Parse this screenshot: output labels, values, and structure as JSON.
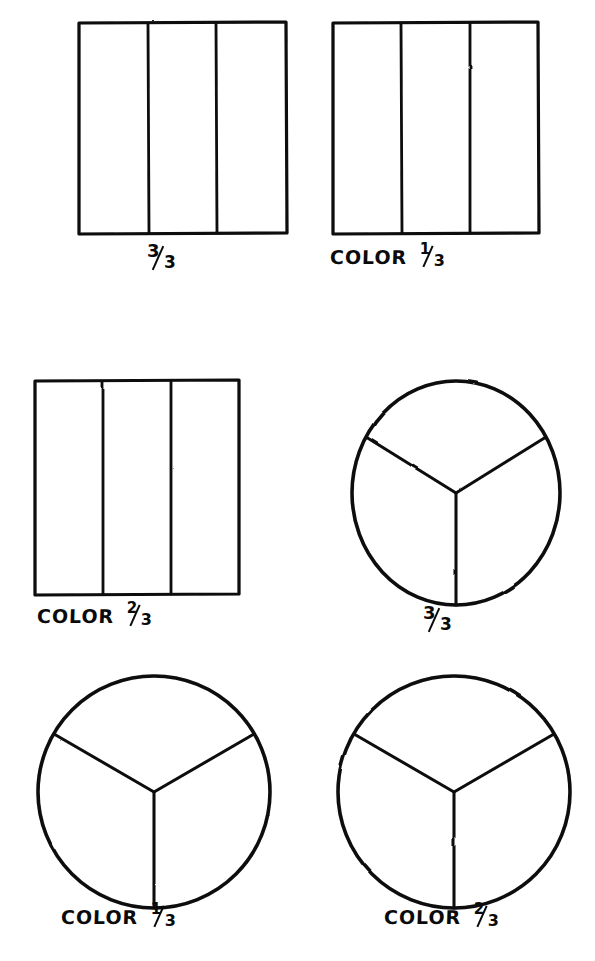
{
  "page": {
    "background_color": "#ffffff",
    "ink_color": "#0a0a0a",
    "width": 595,
    "height": 961
  },
  "figures": [
    {
      "id": "rect-thirds-1",
      "shape": "rectangle",
      "divisions": 3,
      "division_type": "vertical-bars",
      "shaded_parts": 0,
      "label": "3/3",
      "label_prefix": "",
      "label_numerator": "3",
      "label_denominator": "3",
      "row": 1,
      "column": 1
    },
    {
      "id": "rect-thirds-2",
      "shape": "rectangle",
      "divisions": 3,
      "division_type": "vertical-bars",
      "shaded_parts": 1,
      "label": "COLOR 1/3",
      "label_prefix": "COLOR",
      "label_numerator": "1",
      "label_denominator": "3",
      "row": 1,
      "column": 2
    },
    {
      "id": "rect-thirds-3",
      "shape": "rectangle",
      "divisions": 3,
      "division_type": "vertical-bars",
      "shaded_parts": 2,
      "label": "COLOR 2/3",
      "label_prefix": "COLOR",
      "label_numerator": "2",
      "label_denominator": "3",
      "row": 2,
      "column": 1
    },
    {
      "id": "circle-thirds-1",
      "shape": "circle",
      "divisions": 3,
      "division_type": "radial-y",
      "shaded_parts": 0,
      "label": "3/3",
      "label_prefix": "",
      "label_numerator": "3",
      "label_denominator": "3",
      "row": 2,
      "column": 2
    },
    {
      "id": "circle-thirds-2",
      "shape": "circle",
      "divisions": 3,
      "division_type": "radial-y",
      "shaded_parts": 1,
      "label": "COLOR 1/3",
      "label_prefix": "COLOR",
      "label_numerator": "1",
      "label_denominator": "3",
      "row": 3,
      "column": 1
    },
    {
      "id": "circle-thirds-3",
      "shape": "circle",
      "divisions": 3,
      "division_type": "radial-y",
      "shaded_parts": 2,
      "label": "COLOR 2/3",
      "label_prefix": "COLOR",
      "label_numerator": "2",
      "label_denominator": "3",
      "row": 3,
      "column": 2
    }
  ],
  "labels": {
    "color_word": "COLOR",
    "r1c1_num": "3",
    "r1c1_den": "3",
    "r1c2_num": "1",
    "r1c2_den": "3",
    "r2c1_num": "2",
    "r2c1_den": "3",
    "r2c2_num": "3",
    "r2c2_den": "3",
    "r3c1_num": "1",
    "r3c1_den": "3",
    "r3c2_num": "2",
    "r3c2_den": "3"
  },
  "bottom_cut_text": ""
}
